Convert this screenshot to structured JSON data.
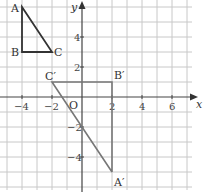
{
  "diagram": {
    "type": "coordinate-grid-transformation",
    "axes": {
      "x_label": "x",
      "y_label": "y",
      "origin_label": "O",
      "x_ticks": [
        "−4",
        "−2",
        "2",
        "4",
        "6"
      ],
      "y_ticks": [
        "4",
        "2",
        "−2",
        "−4"
      ],
      "x_range": [
        -5,
        7
      ],
      "y_range": [
        -6,
        6
      ]
    },
    "original_triangle": {
      "vertices": [
        {
          "label": "A",
          "x": -4,
          "y": 6
        },
        {
          "label": "B",
          "x": -4,
          "y": 3
        },
        {
          "label": "C",
          "x": -2,
          "y": 3
        }
      ],
      "color": "#333333"
    },
    "image_triangle": {
      "vertices": [
        {
          "label": "A′",
          "x": 2,
          "y": -5
        },
        {
          "label": "B′",
          "x": 2,
          "y": 1
        },
        {
          "label": "C′",
          "x": -2,
          "y": 1
        }
      ],
      "color": "#777777"
    },
    "grid_color": "#c8c8c8"
  }
}
